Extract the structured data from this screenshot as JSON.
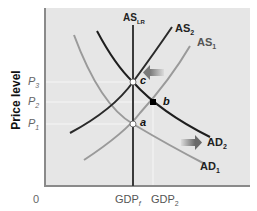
{
  "diagram": {
    "type": "AS-AD model",
    "y_axis_label": "Price level",
    "origin_label": "0",
    "price_levels": [
      {
        "id": "p3",
        "label": "P",
        "sub": "3"
      },
      {
        "id": "p2",
        "label": "P",
        "sub": "2"
      },
      {
        "id": "p1",
        "label": "P",
        "sub": "1"
      }
    ],
    "gdp_levels": [
      {
        "id": "gdpf",
        "label": "GDP",
        "sub": "f"
      },
      {
        "id": "gdp2",
        "label": "GDP",
        "sub": "2"
      }
    ],
    "curves": [
      {
        "id": "aslr",
        "label": "AS",
        "sub": "LR",
        "color": "#3a3a3a"
      },
      {
        "id": "as2",
        "label": "AS",
        "sub": "2",
        "color": "#2a2a2a"
      },
      {
        "id": "as1",
        "label": "AS",
        "sub": "1",
        "color": "#9a9a9a"
      },
      {
        "id": "ad2",
        "label": "AD",
        "sub": "2",
        "color": "#1e1e1e"
      },
      {
        "id": "ad1",
        "label": "AD",
        "sub": "1",
        "color": "#9a9a9a"
      }
    ],
    "points": [
      {
        "id": "c",
        "label": "c"
      },
      {
        "id": "b",
        "label": "b"
      },
      {
        "id": "a",
        "label": "a"
      }
    ],
    "arrows": [
      {
        "id": "as-shift-arrow",
        "direction": "left"
      },
      {
        "id": "ad-shift-arrow",
        "direction": "right"
      }
    ],
    "colors": {
      "plot_bg": "#e6e6e6",
      "axis": "#8a8a8a",
      "guide": "#f6f6f6",
      "arrow": "#8c8c8c"
    }
  }
}
